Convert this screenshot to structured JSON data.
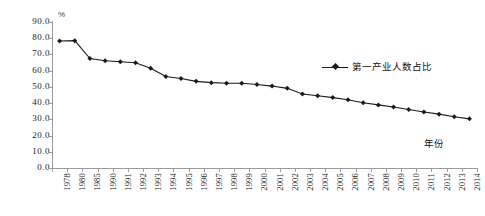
{
  "chart_data": {
    "type": "line",
    "title": "",
    "xlabel": "年份",
    "ylabel": "",
    "unit_label": "%",
    "ylim": [
      0.0,
      90.0
    ],
    "yticks": [
      "0.0",
      "10.0",
      "20.0",
      "30.0",
      "40.0",
      "50.0",
      "60.0",
      "70.0",
      "80.0",
      "90.0"
    ],
    "grid": false,
    "legend_position": "inside-top-right",
    "categories": [
      "1978",
      "1980",
      "1985",
      "1990",
      "1991",
      "1992",
      "1993",
      "1994",
      "1995",
      "1996",
      "1997",
      "1998",
      "1999",
      "2000",
      "2001",
      "2002",
      "2003",
      "2004",
      "2005",
      "2006",
      "2007",
      "2008",
      "2009",
      "2010",
      "2011",
      "2012",
      "2013",
      "2014"
    ],
    "series": [
      {
        "name": "第一产业人数占比",
        "marker": "diamond",
        "color": "#1a1a1a",
        "values": [
          78.3,
          78.5,
          67.5,
          66.1,
          65.5,
          64.9,
          61.5,
          56.4,
          55.2,
          53.4,
          52.6,
          52.2,
          52.2,
          51.5,
          50.5,
          49.1,
          45.6,
          44.5,
          43.4,
          42.1,
          40.2,
          38.9,
          37.6,
          36.1,
          34.5,
          33.2,
          31.6,
          30.3
        ]
      }
    ]
  },
  "legend": {
    "entries": [
      {
        "label": "第一产业人数占比"
      }
    ]
  },
  "axes": {
    "y_unit": "%",
    "x_title": "年份"
  }
}
